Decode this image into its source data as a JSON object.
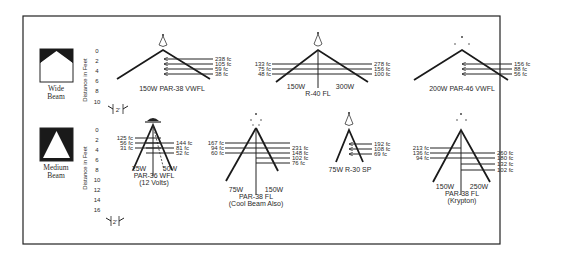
{
  "figure": {
    "distance_axis_label": "Distance in Feet",
    "scale_marker_label": "2'",
    "groups": [
      {
        "name": "wide",
        "label_line1": "Wide",
        "label_line2": "Beam",
        "ticks": [
          "0",
          "2",
          "4",
          "6",
          "8",
          "10"
        ]
      },
      {
        "name": "medium",
        "label_line1": "Medium",
        "label_line2": "Beam",
        "ticks": [
          "0",
          "2",
          "4",
          "6",
          "8",
          "10",
          "12",
          "14",
          "16"
        ]
      }
    ]
  },
  "lamps": [
    {
      "id": "par38-vwfl-150w",
      "title": "150W PAR-38 VWFL",
      "right_values": [
        "238 fc",
        "105 fc",
        "59 fc",
        "38 fc"
      ]
    },
    {
      "id": "r40-fl",
      "title": "R-40 FL",
      "left_watt": "150W",
      "right_watt": "300W",
      "left_values": [
        "133 fc",
        "75 fc",
        "48 fc"
      ],
      "right_values": [
        "278 fc",
        "156 fc",
        "100 fc"
      ]
    },
    {
      "id": "par46-vwfl-200w",
      "title": "200W PAR-46 VWFL",
      "right_values": [
        "156 fc",
        "88 fc",
        "56 fc"
      ]
    },
    {
      "id": "par36-wfl",
      "title": "PAR-36 WFL",
      "subtitle": "(12 Volts)",
      "left_watt": "25W",
      "right_watt": "50W",
      "left_values": [
        "125 fc",
        "56 fc",
        "31 fc"
      ],
      "right_values": [
        "144 fc",
        "81 fc",
        "52 fc"
      ]
    },
    {
      "id": "par38-fl-cool",
      "title": "PAR-38 FL",
      "subtitle": "(Cool Beam Also)",
      "left_watt": "75W",
      "right_watt": "150W",
      "left_values": [
        "167 fc",
        "94 fc",
        "60 fc"
      ],
      "right_values": [
        "231 fc",
        "148 fc",
        "102 fc",
        "76 fc"
      ]
    },
    {
      "id": "r30-sp-75w",
      "title": "75W R-30 SP",
      "right_values": [
        "192 fc",
        "108 fc",
        "69 fc"
      ]
    },
    {
      "id": "par38-fl-krypton",
      "title": "PAR-38 FL",
      "subtitle": "(Krypton)",
      "left_watt": "150W",
      "right_watt": "250W",
      "left_values": [
        "213 fc",
        "136 fc",
        "94 fc"
      ],
      "right_values": [
        "260 fc",
        "180 fc",
        "132 fc",
        "102 fc"
      ]
    }
  ],
  "colors": {
    "ink": "#222222",
    "paper": "#ffffff"
  }
}
